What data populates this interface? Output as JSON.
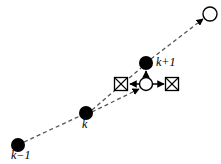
{
  "figure": {
    "type": "diagram",
    "background_color": "#ffffff",
    "stroke_color": "#000000",
    "dashed_color": "#555555",
    "width": 221,
    "height": 164
  },
  "labels": {
    "k_minus_1": "k−1",
    "k": "k",
    "k_plus_1": "k+1"
  },
  "nodes": [
    {
      "id": "k-minus-1",
      "name": "filled-node-k-minus-1",
      "style": "filled-circle",
      "x": 18,
      "y": 145,
      "r": 7,
      "label": "k−1",
      "label_x": 12,
      "label_y": 152
    },
    {
      "id": "k",
      "name": "filled-node-k",
      "style": "filled-circle",
      "x": 86,
      "y": 113,
      "r": 7,
      "label": "k",
      "label_x": 83,
      "label_y": 120
    },
    {
      "id": "k-plus-1",
      "name": "filled-node-k-plus-1",
      "style": "filled-circle",
      "x": 146,
      "y": 63,
      "r": 7,
      "label": "k+1",
      "label_x": 155,
      "label_y": 57
    },
    {
      "id": "predicted",
      "name": "open-node-predicted",
      "style": "open-circle",
      "x": 146,
      "y": 84,
      "r": 7,
      "label": "",
      "label_x": 0,
      "label_y": 0
    },
    {
      "id": "future",
      "name": "open-node-future",
      "style": "open-circle",
      "x": 210,
      "y": 14,
      "r": 7,
      "label": "",
      "label_x": 0,
      "label_y": 0
    }
  ],
  "markers": [
    {
      "id": "marker-left",
      "name": "crossed-box-left",
      "style": "crossed-square",
      "x": 121,
      "y": 84,
      "size": 13
    },
    {
      "id": "marker-right",
      "name": "crossed-box-right",
      "style": "crossed-square",
      "x": 172,
      "y": 84,
      "size": 13
    }
  ],
  "dashed_edges": [
    {
      "id": "edge-km1-k",
      "name": "dashed-edge-k-minus-1-to-k",
      "x1": 24,
      "y1": 142,
      "x2": 80,
      "y2": 116,
      "arrow": false
    },
    {
      "id": "edge-k-kp1",
      "name": "dashed-edge-k-to-k-plus-1",
      "x1": 92,
      "y1": 110,
      "x2": 141,
      "y2": 68,
      "arrow": false
    },
    {
      "id": "edge-k-predicted",
      "name": "dashed-edge-k-to-predicted",
      "x1": 92,
      "y1": 112,
      "x2": 139,
      "y2": 89,
      "arrow": true
    },
    {
      "id": "edge-kp1-future",
      "name": "dashed-edge-k-plus-1-to-future",
      "x1": 151,
      "y1": 59,
      "x2": 203,
      "y2": 19,
      "arrow": true
    }
  ],
  "solid_edges": [
    {
      "id": "edge-predicted-up",
      "name": "solid-arrow-predicted-to-k-plus-1",
      "x1": 146,
      "y1": 77,
      "x2": 146,
      "y2": 71,
      "direction": "up"
    },
    {
      "id": "edge-predicted-left",
      "name": "solid-arrow-predicted-to-marker-left",
      "x1": 139,
      "y1": 84,
      "x2": 129,
      "y2": 84,
      "direction": "left"
    },
    {
      "id": "edge-predicted-right",
      "name": "solid-arrow-predicted-to-marker-right",
      "x1": 153,
      "y1": 84,
      "x2": 164,
      "y2": 84,
      "direction": "right"
    }
  ]
}
